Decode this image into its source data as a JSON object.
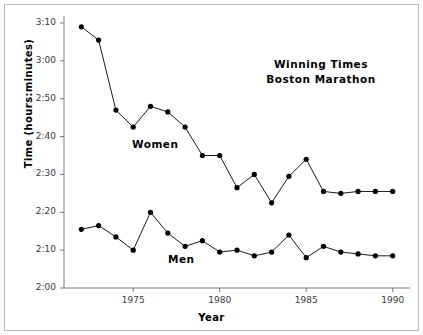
{
  "chart_data": {
    "type": "line",
    "title": "Winning Times\nBoston Marathon",
    "title_line1": "Winning Times",
    "title_line2": "Boston Marathon",
    "xlabel": "Year",
    "ylabel": "Time (hours:minutes)",
    "grid": false,
    "legend_position": "inline-annotations",
    "xlim": [
      1971,
      1991
    ],
    "ylim_minutes": [
      120,
      190
    ],
    "ytick_labels": [
      "2:00",
      "2:10",
      "2:20",
      "2:30",
      "2:40",
      "2:50",
      "3:00",
      "3:10"
    ],
    "ytick_values_minutes": [
      120,
      130,
      140,
      150,
      160,
      170,
      180,
      190
    ],
    "xtick_labels": [
      "1975",
      "1980",
      "1985",
      "1990"
    ],
    "xtick_values": [
      1975,
      1980,
      1985,
      1990
    ],
    "x": [
      1972,
      1973,
      1974,
      1975,
      1976,
      1977,
      1978,
      1979,
      1980,
      1981,
      1982,
      1983,
      1984,
      1985,
      1986,
      1987,
      1988,
      1989,
      1990
    ],
    "series": [
      {
        "name": "Women",
        "label": "Women",
        "marker": "filled-circle",
        "color": "#000000",
        "values_minutes": [
          189.0,
          185.5,
          167.0,
          162.5,
          168.0,
          166.5,
          162.5,
          155.0,
          155.0,
          146.5,
          150.0,
          142.5,
          149.5,
          154.0,
          145.5,
          145.0,
          145.5,
          145.5,
          145.5
        ],
        "values_labels": [
          "3:09",
          "3:05.5",
          "2:47",
          "2:42.5",
          "2:48",
          "2:46.5",
          "2:42.5",
          "2:35",
          "2:35",
          "2:26.5",
          "2:30",
          "2:22.5",
          "2:29.5",
          "2:34",
          "2:25.5",
          "2:25",
          "2:25.5",
          "2:25.5",
          "2:25.5"
        ]
      },
      {
        "name": "Men",
        "label": "Men",
        "marker": "filled-circle",
        "color": "#000000",
        "values_minutes": [
          135.5,
          136.5,
          133.5,
          130.0,
          140.0,
          134.5,
          131.0,
          132.5,
          129.5,
          130.0,
          128.5,
          129.5,
          134.0,
          128.0,
          131.0,
          129.5,
          129.0,
          128.5,
          128.5
        ]
      }
    ]
  },
  "annotations": {
    "women_label": "Women",
    "men_label": "Men"
  }
}
